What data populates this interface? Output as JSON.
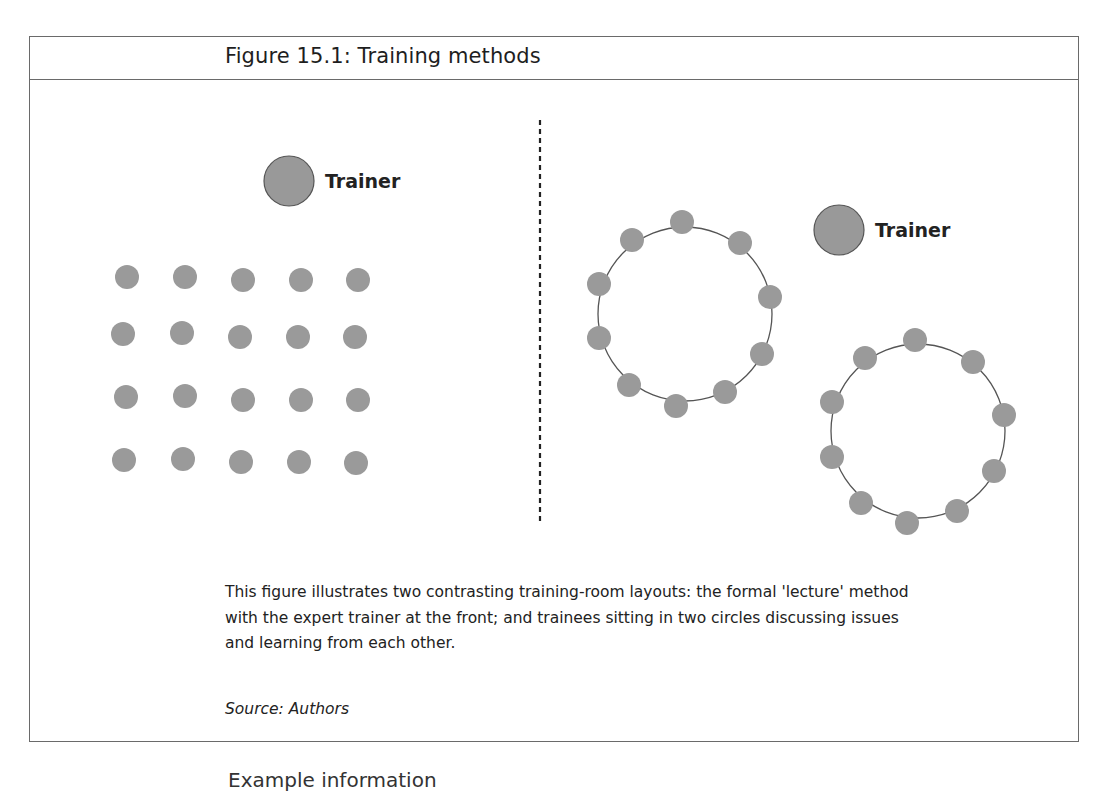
{
  "figure": {
    "title": "Figure 15.1: Training methods",
    "caption_lines": [
      "This figure illustrates two contrasting training-room layouts: the formal 'lecture' method",
      "with the expert trainer at the front; and trainees sitting in two circles discussing issues",
      "and learning from each other."
    ],
    "source": "Source: Authors"
  },
  "diagram": {
    "colors": {
      "dot_fill": "#9a9a9a",
      "trainer_fill": "#999999",
      "trainer_stroke": "#555555",
      "circle_stroke": "#555555",
      "divider": "#222222"
    },
    "left_panel": {
      "layout": "lecture",
      "trainer": {
        "label": "Trainer",
        "cx": 289,
        "cy": 181,
        "r": 25
      },
      "trainee_grid": {
        "rows": 4,
        "cols": 5,
        "r": 12,
        "points": [
          [
            127,
            277
          ],
          [
            185,
            277
          ],
          [
            243,
            280
          ],
          [
            301,
            280
          ],
          [
            358,
            280
          ],
          [
            123,
            334
          ],
          [
            182,
            333
          ],
          [
            240,
            337
          ],
          [
            298,
            337
          ],
          [
            355,
            337
          ],
          [
            126,
            397
          ],
          [
            185,
            396
          ],
          [
            243,
            400
          ],
          [
            301,
            400
          ],
          [
            358,
            400
          ],
          [
            124,
            460
          ],
          [
            183,
            459
          ],
          [
            241,
            462
          ],
          [
            299,
            462
          ],
          [
            356,
            463
          ]
        ]
      }
    },
    "divider": {
      "x": 540,
      "y1": 120,
      "y2": 525,
      "style": "dashed"
    },
    "right_panel": {
      "layout": "discussion circles",
      "trainer": {
        "label": "Trainer",
        "cx": 839,
        "cy": 230,
        "r": 25
      },
      "circles": [
        {
          "cx": 685,
          "cy": 314,
          "r": 87,
          "dot_r": 12,
          "dots": [
            [
              682,
              222
            ],
            [
              632,
              240
            ],
            [
              740,
              243
            ],
            [
              599,
              284
            ],
            [
              770,
              297
            ],
            [
              599,
              338
            ],
            [
              762,
              354
            ],
            [
              629,
              385
            ],
            [
              725,
              392
            ],
            [
              676,
              406
            ]
          ]
        },
        {
          "cx": 918,
          "cy": 431,
          "r": 87,
          "dot_r": 12,
          "dots": [
            [
              915,
              340
            ],
            [
              865,
              358
            ],
            [
              973,
              362
            ],
            [
              832,
              402
            ],
            [
              1004,
              415
            ],
            [
              832,
              457
            ],
            [
              994,
              471
            ],
            [
              861,
              503
            ],
            [
              957,
              511
            ],
            [
              907,
              523
            ]
          ]
        }
      ]
    }
  },
  "below_box_text": "Example information"
}
